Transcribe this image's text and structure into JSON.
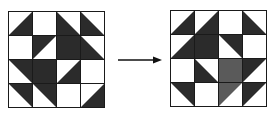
{
  "diagram": {
    "colors": {
      "dark": "#2b2b2b",
      "light_shade": "#5a5a5a",
      "background": "#ffffff",
      "grid_line": "#1a1a1a"
    },
    "left_grid": {
      "rows": [
        [
          "BR",
          "W",
          "BL",
          "BL"
        ],
        [
          "W",
          "TL",
          "FULL",
          "BL"
        ],
        [
          "TR",
          "FULL",
          "BR",
          "W"
        ],
        [
          "TR",
          "TR",
          "W",
          "BR"
        ]
      ]
    },
    "arrow": {
      "direction": "right"
    },
    "right_grid": {
      "rows": [
        [
          "BR",
          "BR",
          "W",
          "BL"
        ],
        [
          "BR",
          "FULL",
          "TR",
          "W"
        ],
        [
          "W",
          "BL",
          "FULL*",
          "TL"
        ],
        [
          "TR",
          "W",
          "TL*",
          "TL"
        ]
      ],
      "note": "* marks cells rendered with a lighter textured shade"
    }
  }
}
